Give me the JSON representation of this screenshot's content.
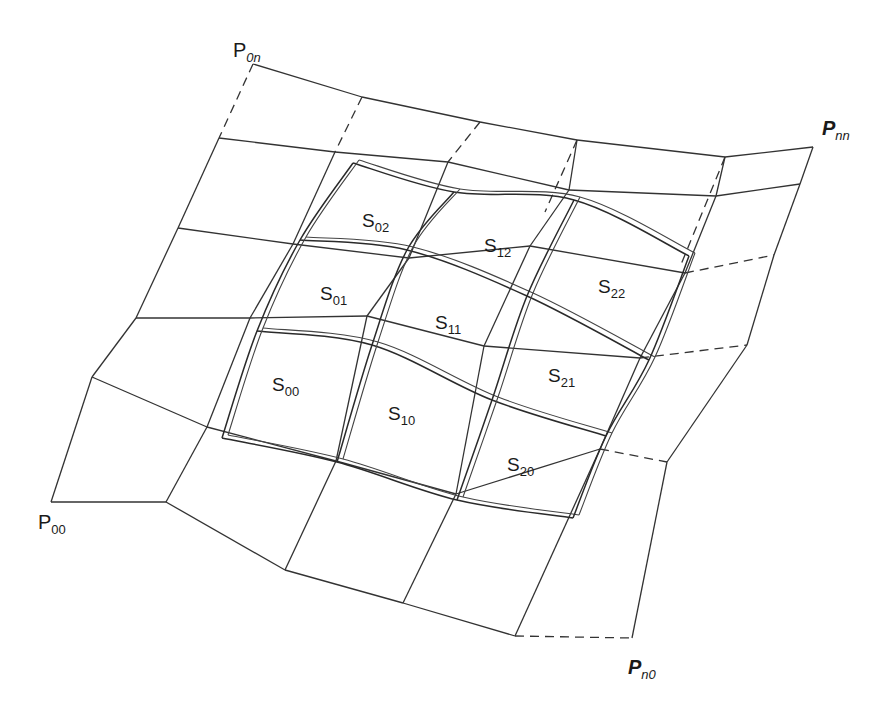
{
  "figure": {
    "corner_labels": [
      {
        "id": "p00",
        "main": "P",
        "sub": "00",
        "italic": false,
        "x": 38,
        "y": 512
      },
      {
        "id": "p0n",
        "main": "P",
        "sub": "0n",
        "italic": false,
        "x": 233,
        "y": 40
      },
      {
        "id": "pnn",
        "main": "P",
        "sub": "nn",
        "italic": true,
        "x": 822,
        "y": 118
      },
      {
        "id": "pn0",
        "main": "P",
        "sub": "n0",
        "italic": true,
        "x": 628,
        "y": 657
      }
    ],
    "patch_labels": [
      {
        "id": "s00",
        "main": "S",
        "sub": "00",
        "x": 272,
        "y": 375
      },
      {
        "id": "s10",
        "main": "S",
        "sub": "10",
        "x": 388,
        "y": 404
      },
      {
        "id": "s20",
        "main": "S",
        "sub": "20",
        "x": 507,
        "y": 455
      },
      {
        "id": "s01",
        "main": "S",
        "sub": "01",
        "x": 320,
        "y": 284
      },
      {
        "id": "s11",
        "main": "S",
        "sub": "11",
        "x": 435,
        "y": 313
      },
      {
        "id": "s21",
        "main": "S",
        "sub": "21",
        "x": 548,
        "y": 366
      },
      {
        "id": "s02",
        "main": "S",
        "sub": "02",
        "x": 362,
        "y": 211
      },
      {
        "id": "s12",
        "main": "S",
        "sub": "12",
        "x": 484,
        "y": 236
      },
      {
        "id": "s22",
        "main": "S",
        "sub": "22",
        "x": 598,
        "y": 277
      }
    ],
    "control_grid": {
      "rows_note": "rows listed from bottom (v=0) to top (v=n); each row lists points from left (u=0) to right (u=n)",
      "rows": [
        [
          [
            51,
            502
          ],
          [
            166,
            502
          ],
          [
            285,
            570
          ],
          [
            403,
            603
          ],
          [
            515,
            636
          ],
          [
            632,
            638
          ]
        ],
        [
          [
            92,
            377
          ],
          [
            207,
            427
          ],
          [
            336,
            461
          ],
          [
            456,
            494
          ],
          [
            600,
            449
          ],
          [
            667,
            462
          ]
        ],
        [
          [
            136,
            318
          ],
          [
            250,
            318
          ],
          [
            367,
            316
          ],
          [
            484,
            346
          ],
          [
            640,
            358
          ],
          [
            747,
            345
          ]
        ],
        [
          [
            178,
            228
          ],
          [
            293,
            244
          ],
          [
            409,
            258
          ],
          [
            530,
            246
          ],
          [
            685,
            273
          ],
          [
            774,
            255
          ]
        ],
        [
          [
            219,
            138
          ],
          [
            335,
            152
          ],
          [
            448,
            162
          ],
          [
            569,
            190
          ],
          [
            716,
            196
          ],
          [
            800,
            184
          ]
        ],
        [
          [
            253,
            64
          ],
          [
            362,
            97
          ],
          [
            480,
            122
          ],
          [
            577,
            140
          ],
          [
            725,
            157
          ],
          [
            813,
            147
          ]
        ]
      ],
      "dashed_segments": [
        [
          [
            253,
            64
          ],
          [
            219,
            138
          ]
        ],
        [
          [
            362,
            97
          ],
          [
            335,
            152
          ]
        ],
        [
          [
            480,
            122
          ],
          [
            448,
            162
          ]
        ],
        [
          [
            577,
            140
          ],
          [
            545,
            212
          ]
        ],
        [
          [
            725,
            157
          ],
          [
            680,
            267
          ]
        ],
        [
          [
            685,
            273
          ],
          [
            774,
            255
          ]
        ],
        [
          [
            640,
            358
          ],
          [
            747,
            345
          ]
        ],
        [
          [
            600,
            449
          ],
          [
            667,
            462
          ]
        ],
        [
          [
            515,
            636
          ],
          [
            632,
            638
          ]
        ]
      ],
      "solid_skip_note": "segments replaced by dashed ones are not drawn solid"
    },
    "patches": {
      "offset": [
        6,
        -3
      ],
      "rows": [
        [
          [
            222,
            438
          ],
          [
            337,
            462
          ],
          [
            457,
            500
          ],
          [
            573,
            518
          ]
        ],
        [
          [
            257,
            331
          ],
          [
            372,
            345
          ],
          [
            492,
            400
          ],
          [
            606,
            436
          ]
        ],
        [
          [
            300,
            240
          ],
          [
            407,
            250
          ],
          [
            527,
            296
          ],
          [
            649,
            360
          ]
        ],
        [
          [
            353,
            163
          ],
          [
            454,
            192
          ],
          [
            574,
            200
          ],
          [
            689,
            256
          ]
        ]
      ]
    }
  }
}
